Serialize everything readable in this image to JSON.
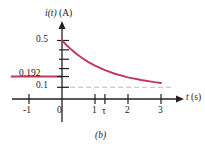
{
  "figure": {
    "panel_label": "(b)",
    "y_axis_label_parts": {
      "var": "i",
      "arg": "(t)",
      "unit": "(A)"
    },
    "y_axis_label": "i(t) (A)",
    "x_axis_label_parts": {
      "var": "t",
      "unit": "(s)"
    },
    "x_axis_label": "t (s)"
  },
  "colors": {
    "curve": "#c4365c",
    "marker_line": "#c4365c",
    "asymptote": "#d8c3c9",
    "axis": "#231f20",
    "text": "#1a1a1a"
  },
  "chart_data": {
    "type": "line",
    "title": "",
    "xlabel": "t (s)",
    "ylabel": "i(t) (A)",
    "xlim": [
      -1.5,
      3.6
    ],
    "ylim": [
      0,
      0.58
    ],
    "grid": false,
    "legend": "none",
    "x_ticks": [
      {
        "value": -1,
        "label": "-1"
      },
      {
        "value": 0,
        "label": "0"
      },
      {
        "value": 1,
        "label": "1"
      },
      {
        "value": 1.3,
        "label": "τ"
      },
      {
        "value": 2,
        "label": "2"
      },
      {
        "value": 3,
        "label": "3"
      }
    ],
    "y_ticks": [
      {
        "value": 0.5,
        "label": "0.5"
      },
      {
        "value": 0.42,
        "label": ""
      },
      {
        "value": 0.34,
        "label": ""
      },
      {
        "value": 0.26,
        "label": ""
      },
      {
        "value": 0.192,
        "label": "0.192"
      },
      {
        "value": 0.1,
        "label": "0.1"
      }
    ],
    "series": [
      {
        "name": "i(t)",
        "kind": "exponential-decay",
        "equation": "i(t) = 0.1 + 0.4 e^(-t/1.3)",
        "x": [
          0,
          0.15,
          0.3,
          0.45,
          0.6,
          0.8,
          1.0,
          1.3,
          1.6,
          2.0,
          2.4,
          2.8,
          3.0
        ],
        "y": [
          0.5,
          0.457,
          0.418,
          0.383,
          0.352,
          0.315,
          0.285,
          0.247,
          0.216,
          0.185,
          0.162,
          0.144,
          0.137
        ]
      }
    ],
    "annotations": [
      {
        "name": "value-marker-0.192",
        "type": "hline",
        "y": 0.192,
        "x_from": -1.55,
        "x_to": 0.0,
        "style": "solid",
        "color": "#c4365c"
      },
      {
        "name": "asymptote-0.1",
        "type": "hline",
        "y": 0.1,
        "x_from": 0.0,
        "x_to": 3.35,
        "style": "dashed",
        "color": "#d8c3c9"
      }
    ]
  }
}
